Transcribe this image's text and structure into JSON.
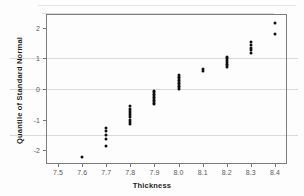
{
  "chart_data": {
    "type": "scatter",
    "title": "",
    "xlabel": "Thickness",
    "ylabel": "Quantile of Standard Normal",
    "xlim": [
      7.45,
      8.45
    ],
    "ylim": [
      -2.45,
      2.45
    ],
    "xticks": [
      "7.5",
      "7.6",
      "7.7",
      "7.8",
      "7.9",
      "8.0",
      "8.1",
      "8.2",
      "8.3",
      "8.4"
    ],
    "xtick_values": [
      7.5,
      7.6,
      7.7,
      7.8,
      7.9,
      8.0,
      8.1,
      8.2,
      8.3,
      8.4
    ],
    "yticks": [
      "2",
      "1",
      "0",
      "-1",
      "-2"
    ],
    "ytick_values": [
      2,
      1,
      0,
      -1,
      -2
    ],
    "gridlines": {
      "horizontal": [
        1,
        0,
        -1.5
      ],
      "vertical": [],
      "grid_on": true
    },
    "legend": null,
    "marker_color": "#101010",
    "grid_color": "#d9d9d9",
    "frame_color": "#7d7d7d",
    "points": [
      [
        7.6,
        -2.22
      ],
      [
        7.7,
        -1.85
      ],
      [
        7.7,
        -1.62
      ],
      [
        7.7,
        -1.5
      ],
      [
        7.7,
        -1.38
      ],
      [
        7.7,
        -1.26
      ],
      [
        7.8,
        -1.14
      ],
      [
        7.8,
        -1.07
      ],
      [
        7.8,
        -1.0
      ],
      [
        7.8,
        -0.93
      ],
      [
        7.8,
        -0.86
      ],
      [
        7.8,
        -0.79
      ],
      [
        7.8,
        -0.72
      ],
      [
        7.8,
        -0.64
      ],
      [
        7.8,
        -0.57
      ],
      [
        7.9,
        -0.5
      ],
      [
        7.9,
        -0.45
      ],
      [
        7.9,
        -0.4
      ],
      [
        7.9,
        -0.35
      ],
      [
        7.9,
        -0.3
      ],
      [
        7.9,
        -0.25
      ],
      [
        7.9,
        -0.2
      ],
      [
        7.9,
        -0.15
      ],
      [
        7.9,
        -0.1
      ],
      [
        7.9,
        -0.05
      ],
      [
        8.0,
        0.0
      ],
      [
        8.0,
        0.05
      ],
      [
        8.0,
        0.1
      ],
      [
        8.0,
        0.15
      ],
      [
        8.0,
        0.2
      ],
      [
        8.0,
        0.25
      ],
      [
        8.0,
        0.3
      ],
      [
        8.0,
        0.35
      ],
      [
        8.0,
        0.4
      ],
      [
        8.0,
        0.46
      ],
      [
        8.1,
        0.6
      ],
      [
        8.1,
        0.64
      ],
      [
        8.2,
        0.71
      ],
      [
        8.2,
        0.77
      ],
      [
        8.2,
        0.83
      ],
      [
        8.2,
        0.89
      ],
      [
        8.2,
        0.95
      ],
      [
        8.2,
        1.01
      ],
      [
        8.2,
        1.06
      ],
      [
        8.3,
        1.19
      ],
      [
        8.3,
        1.27
      ],
      [
        8.3,
        1.35
      ],
      [
        8.3,
        1.44
      ],
      [
        8.3,
        1.54
      ],
      [
        8.4,
        1.79
      ],
      [
        8.4,
        2.15
      ]
    ]
  }
}
